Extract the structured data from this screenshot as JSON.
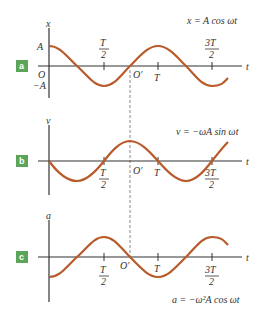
{
  "figure": {
    "dashed_line": {
      "x": 130,
      "y1": 70,
      "y2": 257,
      "color": "#888888"
    },
    "curve_color": "#b85a2a",
    "axis_color": "#333333",
    "badge_color": "#5aa55a",
    "panels": [
      {
        "id": "a",
        "badge": "a",
        "y_label": "x",
        "t_label": "t",
        "equation": "x = A cos ωt",
        "amplitude_labels": {
          "pos": "A",
          "neg": "−A"
        },
        "origin_label": "O",
        "shifted_origin_label": "O′",
        "ticks": [
          {
            "label": "T",
            "den": "2",
            "fraction": true,
            "position": "above"
          },
          {
            "label": "T",
            "fraction": false,
            "position": "below"
          },
          {
            "label": "3T",
            "den": "2",
            "fraction": true,
            "position": "above"
          }
        ],
        "function": "cos"
      },
      {
        "id": "b",
        "badge": "b",
        "y_label": "v",
        "t_label": "t",
        "equation": "v = −ωA sin ωt",
        "shifted_origin_label": "O′",
        "ticks": [
          {
            "label": "T",
            "den": "2",
            "fraction": true,
            "position": "below"
          },
          {
            "label": "T",
            "fraction": false,
            "position": "below"
          },
          {
            "label": "3T",
            "den": "2",
            "fraction": true,
            "position": "below"
          }
        ],
        "function": "-sin"
      },
      {
        "id": "c",
        "badge": "c",
        "y_label": "a",
        "t_label": "t",
        "equation": "a = −ω²A cos ωt",
        "shifted_origin_label": "O′",
        "ticks": [
          {
            "label": "T",
            "den": "2",
            "fraction": true,
            "position": "below"
          },
          {
            "label": "T",
            "fraction": false,
            "position": "below"
          },
          {
            "label": "3T",
            "den": "2",
            "fraction": true,
            "position": "below"
          }
        ],
        "function": "-cos"
      }
    ]
  }
}
